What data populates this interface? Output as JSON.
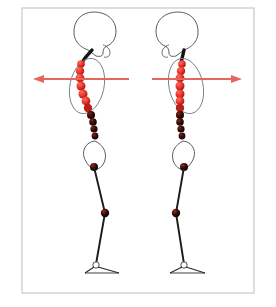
{
  "canvas": {
    "width": 276,
    "height": 307,
    "background": "#ffffff"
  },
  "frame": {
    "label": "Diagram frame border",
    "x": 22,
    "y": 8,
    "width": 232,
    "height": 285,
    "stroke": "#c8c8cc",
    "stroke_width": 1.2,
    "fill": "#ffffff"
  },
  "palette": {
    "bead_bright_red": "#e8332a",
    "bead_mid_red": "#c4201a",
    "bead_dark": "#2a0a08",
    "bead_black": "#140403",
    "bone_outline": "#4a4a52",
    "thorax_outline": "#6d7f8c",
    "spine_cord": "#141414",
    "leg_line": "#1c1c1c",
    "arrow_red": "#e2675f",
    "frame_gray": "#c8c8cc",
    "background": "#ffffff"
  },
  "figures": [
    {
      "id": "figure-left",
      "name": "left-posture-figure",
      "facing": "right",
      "description": "Side-view postural figure facing right with curved bead spine",
      "skull": {
        "name": "skull-outline",
        "cx": 92,
        "cy": 32,
        "rx": 22,
        "ry": 18,
        "rotation": -8
      },
      "cervical_cord": {
        "name": "cervical-cord",
        "from_x": 88,
        "from_y": 47,
        "to_x": 82,
        "to_y": 62
      },
      "thorax": {
        "name": "thorax-ellipse",
        "cx": 87,
        "cy": 86,
        "rx": 17,
        "ry": 28,
        "rotation": 12
      },
      "pelvis": {
        "name": "pelvis-outline",
        "cx": 92,
        "cy": 152,
        "width": 22,
        "height": 30
      },
      "arrow": {
        "name": "force-arrow-left",
        "direction": "left",
        "tail_x": 128,
        "tip_x": 34,
        "y": 79,
        "color": "#e2675f"
      },
      "spine_beads": [
        {
          "cx": 81,
          "cy": 64,
          "r": 3.8,
          "color": "#e8332a"
        },
        {
          "cx": 80,
          "cy": 71,
          "r": 4.2,
          "color": "#e8332a"
        },
        {
          "cx": 80,
          "cy": 78,
          "r": 4.4,
          "color": "#e8332a"
        },
        {
          "cx": 81,
          "cy": 86,
          "r": 4.5,
          "color": "#e8332a"
        },
        {
          "cx": 83,
          "cy": 94,
          "r": 4.5,
          "color": "#e03129"
        },
        {
          "cx": 86,
          "cy": 101,
          "r": 4.4,
          "color": "#d62b23"
        },
        {
          "cx": 88,
          "cy": 108,
          "r": 4.2,
          "color": "#b8201a"
        },
        {
          "cx": 91,
          "cy": 115,
          "r": 4.0,
          "color": "#7a1410"
        },
        {
          "cx": 93,
          "cy": 122,
          "r": 3.8,
          "color": "#3d0c09"
        },
        {
          "cx": 94,
          "cy": 129,
          "r": 3.6,
          "color": "#240705"
        },
        {
          "cx": 95,
          "cy": 136,
          "r": 3.4,
          "color": "#180504"
        }
      ],
      "sacrum_bead": {
        "name": "sacrum-joint",
        "cx": 94,
        "cy": 167,
        "r": 4.0,
        "color": "#2a0a08"
      },
      "knee": {
        "name": "knee-joint",
        "cx": 105,
        "cy": 213,
        "r": 4.2,
        "color": "#2a0a08"
      },
      "leg": {
        "name": "leg-line",
        "hip_x": 94,
        "hip_y": 167,
        "knee_x": 105,
        "knee_y": 213,
        "ankle_x": 96,
        "ankle_y": 265
      },
      "foot": {
        "name": "foot-outline",
        "ankle_x": 96,
        "ankle_y": 265,
        "toe_x": 118,
        "toe_y": 272,
        "heel_x": 84,
        "heel_y": 272,
        "direction": "right"
      }
    },
    {
      "id": "figure-right",
      "name": "right-posture-figure",
      "facing": "left",
      "description": "Side-view postural figure facing left with straighter bead spine",
      "skull": {
        "name": "skull-outline",
        "cx": 180,
        "cy": 32,
        "rx": 22,
        "ry": 18,
        "rotation": 8
      },
      "cervical_cord": {
        "name": "cervical-cord",
        "from_x": 184,
        "from_y": 47,
        "to_x": 182,
        "to_y": 62
      },
      "thorax": {
        "name": "thorax-ellipse",
        "cx": 186,
        "cy": 86,
        "rx": 17,
        "ry": 28,
        "rotation": -12
      },
      "pelvis": {
        "name": "pelvis-outline",
        "cx": 182,
        "cy": 152,
        "width": 22,
        "height": 30
      },
      "arrow": {
        "name": "force-arrow-right",
        "direction": "right",
        "tail_x": 152,
        "tip_x": 242,
        "y": 79,
        "color": "#e2675f"
      },
      "spine_beads": [
        {
          "cx": 182,
          "cy": 64,
          "r": 3.8,
          "color": "#e8332a"
        },
        {
          "cx": 181,
          "cy": 71,
          "r": 4.2,
          "color": "#e8332a"
        },
        {
          "cx": 180,
          "cy": 78,
          "r": 4.4,
          "color": "#e8332a"
        },
        {
          "cx": 180,
          "cy": 86,
          "r": 4.5,
          "color": "#e8332a"
        },
        {
          "cx": 180,
          "cy": 94,
          "r": 4.5,
          "color": "#e03129"
        },
        {
          "cx": 180,
          "cy": 101,
          "r": 4.4,
          "color": "#d62b23"
        },
        {
          "cx": 180,
          "cy": 108,
          "r": 4.2,
          "color": "#b8201a"
        },
        {
          "cx": 180,
          "cy": 115,
          "r": 4.0,
          "color": "#7a1410"
        },
        {
          "cx": 180,
          "cy": 122,
          "r": 3.8,
          "color": "#3d0c09"
        },
        {
          "cx": 181,
          "cy": 129,
          "r": 3.6,
          "color": "#240705"
        },
        {
          "cx": 182,
          "cy": 136,
          "r": 3.4,
          "color": "#180504"
        }
      ],
      "sacrum_bead": {
        "name": "sacrum-joint",
        "cx": 184,
        "cy": 167,
        "r": 4.0,
        "color": "#2a0a08"
      },
      "knee": {
        "name": "knee-joint",
        "cx": 176,
        "cy": 213,
        "r": 4.2,
        "color": "#2a0a08"
      },
      "leg": {
        "name": "leg-line",
        "hip_x": 184,
        "hip_y": 167,
        "knee_x": 176,
        "knee_y": 213,
        "ankle_x": 184,
        "ankle_y": 265
      },
      "foot": {
        "name": "foot-outline",
        "ankle_x": 184,
        "ankle_y": 265,
        "toe_x": 204,
        "toe_y": 272,
        "heel_x": 168,
        "heel_y": 272,
        "direction": "right"
      }
    }
  ]
}
